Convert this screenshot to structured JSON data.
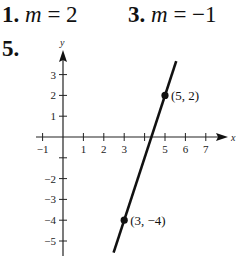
{
  "answers": [
    {
      "number": "1.",
      "var": "m",
      "eq": " = 2"
    },
    {
      "number": "3.",
      "var": "m",
      "eq": " = −1"
    },
    {
      "number": "5."
    }
  ],
  "chart_data": {
    "type": "line",
    "title": "",
    "xlabel": "x",
    "ylabel": "y",
    "xlim": [
      -1,
      7
    ],
    "ylim": [
      -5,
      3
    ],
    "x_ticks": [
      "-1",
      "1",
      "2",
      "3",
      "5",
      "6",
      "7"
    ],
    "y_ticks": [
      "3",
      "2",
      "1",
      "-2",
      "-3",
      "-4",
      "-5"
    ],
    "grid": false,
    "series": [
      {
        "name": "line through points",
        "x": [
          3,
          5
        ],
        "y": [
          -4,
          2
        ],
        "slope": 3
      }
    ],
    "points": [
      {
        "x": 5,
        "y": 2,
        "label": "(5, 2)"
      },
      {
        "x": 3,
        "y": -4,
        "label": "(3, −4)"
      }
    ]
  }
}
